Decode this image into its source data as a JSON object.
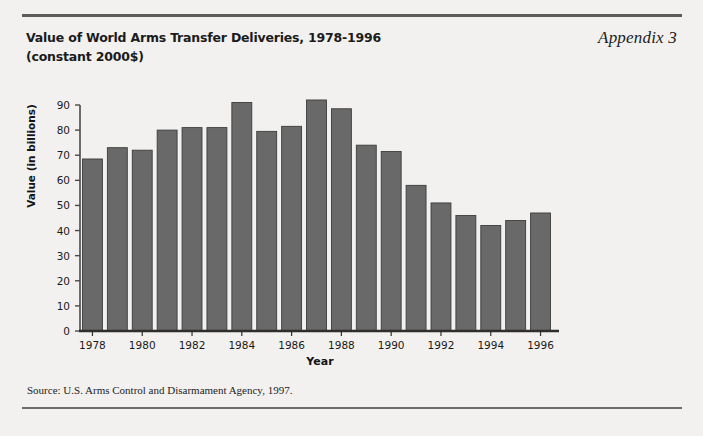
{
  "page": {
    "background_color": "#f2f1ef",
    "rule_color": "#5b5b5b"
  },
  "header": {
    "title_line1": "Value of World Arms Transfer Deliveries, 1978-1996",
    "title_line2": "(constant 2000$)",
    "appendix_label": "Appendix 3"
  },
  "footer": {
    "source": "Source: U.S. Arms Control and Disarmament Agency, 1997."
  },
  "chart_data": {
    "type": "bar",
    "title": "Value of World Arms Transfer Deliveries, 1978-1996 (constant 2000$)",
    "xlabel": "Year",
    "ylabel": "Value (in billions)",
    "ylim": [
      0,
      90
    ],
    "ytick_values": [
      0,
      10,
      20,
      30,
      40,
      50,
      60,
      70,
      80,
      90
    ],
    "ytick_labels": [
      "0",
      "10",
      "20",
      "30",
      "40",
      "50",
      "60",
      "70",
      "80",
      "90"
    ],
    "xtick_labels": [
      "1978",
      "1980",
      "1982",
      "1984",
      "1986",
      "1988",
      "1990",
      "1992",
      "1994",
      "1996"
    ],
    "categories": [
      "1978",
      "1979",
      "1980",
      "1981",
      "1982",
      "1983",
      "1984",
      "1985",
      "1986",
      "1987",
      "1988",
      "1989",
      "1990",
      "1991",
      "1992",
      "1993",
      "1994",
      "1995",
      "1996"
    ],
    "values": [
      68.5,
      73,
      72,
      80,
      81,
      81,
      91,
      79.5,
      81.5,
      92,
      88.5,
      74,
      71.5,
      58,
      51,
      46,
      42,
      44,
      47
    ],
    "bar_color": "#696969",
    "bar_edge_color": "#3c3c3c",
    "grid": false,
    "legend": "none"
  }
}
